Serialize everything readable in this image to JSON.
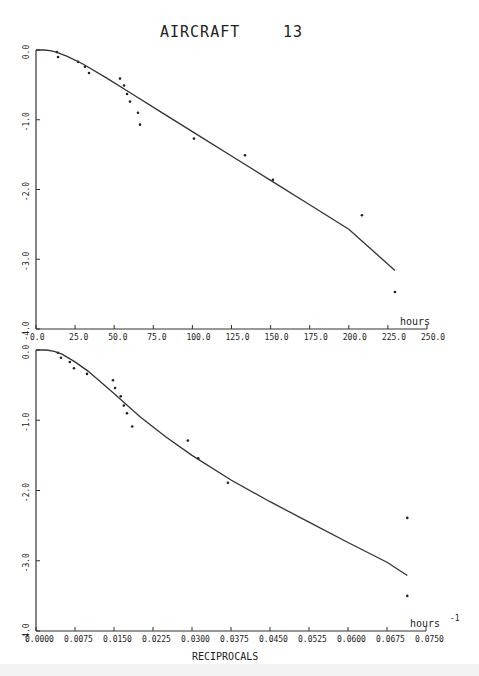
{
  "page": {
    "title": "AIRCRAFT",
    "title_number": "13"
  },
  "chart_data": [
    {
      "type": "scatter",
      "title": "AIRCRAFT 13",
      "xlabel": "hours",
      "ylabel": "",
      "xlim": [
        0,
        250
      ],
      "ylim": [
        -4.0,
        0.0
      ],
      "grid": false,
      "x_ticks": [
        "0.0",
        "25.0",
        "50.0",
        "75.0",
        "100.0",
        "125.0",
        "150.0",
        "175.0",
        "200.0",
        "225.0",
        "250.0"
      ],
      "y_ticks": [
        "0.0",
        "-1.0",
        "-2.0",
        "-3.0",
        "-4.0"
      ],
      "series": [
        {
          "name": "observed",
          "kind": "points",
          "x": [
            13.4,
            14.1,
            26.9,
            31.3,
            33.9,
            53.7,
            56.3,
            58.2,
            60.1,
            65.2,
            66.5,
            101.0,
            133.6,
            151.5,
            208.4,
            229.5
          ],
          "y": [
            -0.03,
            -0.1,
            -0.17,
            -0.24,
            -0.33,
            -0.41,
            -0.51,
            -0.63,
            -0.74,
            -0.9,
            -1.07,
            -1.27,
            -1.51,
            -1.86,
            -2.37,
            -3.47
          ]
        },
        {
          "name": "fitted",
          "kind": "line",
          "x": [
            0,
            5,
            9,
            13,
            20,
            30,
            45,
            60,
            80,
            100,
            125,
            150,
            175,
            200,
            229.5
          ],
          "y": [
            0.0,
            0.0,
            -0.01,
            -0.03,
            -0.09,
            -0.2,
            -0.4,
            -0.61,
            -0.89,
            -1.17,
            -1.52,
            -1.87,
            -2.22,
            -2.57,
            -3.16
          ]
        }
      ]
    },
    {
      "type": "scatter",
      "title": "",
      "xlabel": "RECIPROCALS",
      "x_unit": "hours",
      "x_unit_exp": "-1",
      "ylabel": "",
      "xlim": [
        0.0,
        0.075
      ],
      "ylim": [
        -4.0,
        0.0
      ],
      "grid": false,
      "x_ticks": [
        "0.0000",
        "0.0075",
        "0.0150",
        "0.0225",
        "0.0300",
        "0.0375",
        "0.0450",
        "0.0525",
        "0.0600",
        "0.0675",
        "0.0750"
      ],
      "y_ticks": [
        "0.0",
        "-1.0",
        "-2.0",
        "-3.0",
        "-4.0"
      ],
      "series": [
        {
          "name": "observed",
          "kind": "points",
          "x": [
            0.0042,
            0.0048,
            0.0065,
            0.0073,
            0.0098,
            0.0148,
            0.0152,
            0.0163,
            0.0169,
            0.0175,
            0.0185,
            0.0292,
            0.0312,
            0.0369,
            0.0714,
            0.0714
          ],
          "y": [
            -0.04,
            -0.11,
            -0.17,
            -0.26,
            -0.34,
            -0.43,
            -0.54,
            -0.66,
            -0.79,
            -0.9,
            -1.09,
            -1.29,
            -1.54,
            -1.89,
            -2.39,
            -3.5
          ]
        },
        {
          "name": "fitted",
          "kind": "line",
          "x": [
            0.0,
            0.002,
            0.0035,
            0.005,
            0.0075,
            0.01,
            0.015,
            0.02,
            0.025,
            0.03,
            0.0375,
            0.045,
            0.0525,
            0.06,
            0.0675,
            0.0714
          ],
          "y": [
            0.0,
            0.0,
            -0.02,
            -0.06,
            -0.17,
            -0.3,
            -0.62,
            -0.95,
            -1.24,
            -1.5,
            -1.85,
            -2.16,
            -2.45,
            -2.74,
            -3.02,
            -3.21
          ]
        }
      ]
    }
  ]
}
